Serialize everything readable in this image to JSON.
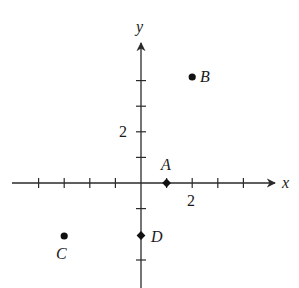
{
  "diagram": {
    "type": "coordinate-plane",
    "axes": {
      "x_label": "x",
      "y_label": "y",
      "x_range": [
        -5,
        5
      ],
      "y_range": [
        -4,
        5
      ],
      "unit_ticks": true,
      "x_tick_label": "2",
      "y_tick_label": "2"
    },
    "points": [
      {
        "id": "A",
        "label": "A",
        "x": 1,
        "y": 0,
        "marker": "diamond"
      },
      {
        "id": "B",
        "label": "B",
        "x": 2,
        "y": 4,
        "marker": "circle"
      },
      {
        "id": "C",
        "label": "C",
        "x": -3,
        "y": -2,
        "marker": "circle"
      },
      {
        "id": "D",
        "label": "D",
        "x": 0,
        "y": -2,
        "marker": "diamond"
      }
    ]
  }
}
